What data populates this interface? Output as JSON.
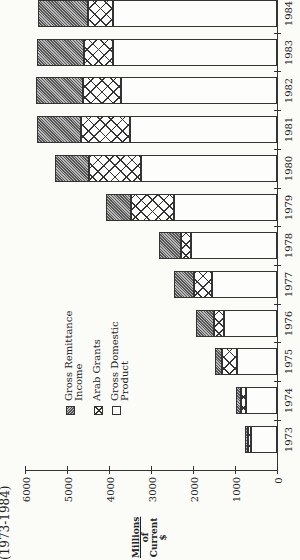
{
  "chart_data": {
    "type": "bar",
    "stacked": true,
    "orientation": "vertical (image rotated 90° clockwise)",
    "title": "(1973-1984)",
    "xlabel": "",
    "ylabel": "Millions of Current $",
    "ylim": [
      0,
      6000
    ],
    "yticks": [
      0,
      1000,
      2000,
      3000,
      4000,
      5000,
      6000
    ],
    "categories": [
      "1973",
      "1974",
      "1975",
      "1976",
      "1977",
      "1978",
      "1979",
      "1980",
      "1981",
      "1982",
      "1983",
      "1984"
    ],
    "series": [
      {
        "name": "Gross Domestic Product",
        "pattern": "blank",
        "values": [
          620,
          740,
          950,
          1260,
          1550,
          2050,
          2450,
          3240,
          3500,
          3710,
          3900,
          3900
        ]
      },
      {
        "name": "Arab Grants",
        "pattern": "crosshatch",
        "values": [
          70,
          120,
          360,
          240,
          430,
          240,
          1030,
          1240,
          1170,
          910,
          700,
          600
        ]
      },
      {
        "name": "Gross Remittance Income",
        "pattern": "diagonal-hatch",
        "values": [
          70,
          120,
          170,
          430,
          470,
          520,
          590,
          810,
          1040,
          1120,
          1110,
          1200
        ]
      }
    ],
    "totals": [
      760,
      980,
      1480,
      1930,
      2450,
      2810,
      4070,
      5290,
      5710,
      5740,
      5710,
      5700
    ],
    "legend": {
      "position": "inside, left of lower bars",
      "entries": [
        "Gross Remittance Income",
        "Arab Grants",
        "Gross Domestic Product"
      ]
    },
    "grid": false
  },
  "labels": {
    "title_fragment": "(1973-1984)",
    "ylabel_lines": [
      "Millions",
      "of",
      "Current",
      "$"
    ],
    "legend": [
      {
        "key": "remit",
        "text": "Gross Remittance\nIncome"
      },
      {
        "key": "arab",
        "text": "Arab Grants"
      },
      {
        "key": "gdp",
        "text": "Gross Domestic\nProduct"
      }
    ]
  }
}
